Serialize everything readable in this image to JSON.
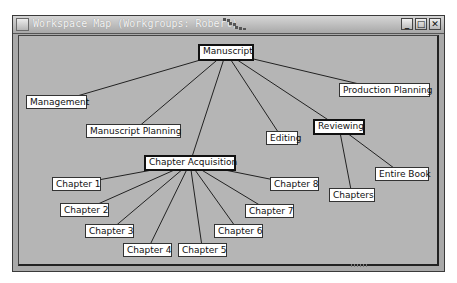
{
  "window": {
    "title": "Workspace Map (Workgroups: Robert)",
    "buttons": {
      "minimize": "_",
      "maximize": "□",
      "close": "✕"
    }
  },
  "map": {
    "root": {
      "id": "manuscript",
      "label": "Manuscript",
      "x": 198,
      "y": 44,
      "w": 56,
      "h": 17,
      "bold": true
    },
    "nodes": [
      {
        "id": "management",
        "label": "Management",
        "x": 26,
        "y": 95,
        "w": 61,
        "h": 14,
        "bold": false,
        "parent": "manuscript"
      },
      {
        "id": "manuscript-planning",
        "label": "Manuscript Planning",
        "x": 86,
        "y": 124,
        "w": 95,
        "h": 14,
        "bold": false,
        "parent": "manuscript"
      },
      {
        "id": "editing",
        "label": "Editing",
        "x": 266,
        "y": 131,
        "w": 32,
        "h": 14,
        "bold": false,
        "parent": "manuscript"
      },
      {
        "id": "production-planning",
        "label": "Production Planning",
        "x": 339,
        "y": 83,
        "w": 91,
        "h": 14,
        "bold": false,
        "parent": "manuscript"
      },
      {
        "id": "reviewing",
        "label": "Reviewing",
        "x": 313,
        "y": 119,
        "w": 52,
        "h": 16,
        "bold": true,
        "parent": "manuscript"
      },
      {
        "id": "entire-book",
        "label": "Entire Book",
        "x": 375,
        "y": 167,
        "w": 54,
        "h": 14,
        "bold": false,
        "parent": "reviewing"
      },
      {
        "id": "chapters",
        "label": "Chapters",
        "x": 329,
        "y": 188,
        "w": 46,
        "h": 14,
        "bold": false,
        "parent": "reviewing"
      },
      {
        "id": "chapter-acquisition",
        "label": "Chapter Acquisition",
        "x": 144,
        "y": 155,
        "w": 92,
        "h": 16,
        "bold": true,
        "parent": "manuscript"
      },
      {
        "id": "chapter-1",
        "label": "Chapter 1",
        "x": 52,
        "y": 177,
        "w": 49,
        "h": 14,
        "bold": false,
        "parent": "chapter-acquisition"
      },
      {
        "id": "chapter-2",
        "label": "Chapter 2",
        "x": 60,
        "y": 203,
        "w": 49,
        "h": 14,
        "bold": false,
        "parent": "chapter-acquisition"
      },
      {
        "id": "chapter-3",
        "label": "Chapter 3",
        "x": 85,
        "y": 224,
        "w": 49,
        "h": 14,
        "bold": false,
        "parent": "chapter-acquisition"
      },
      {
        "id": "chapter-4",
        "label": "Chapter 4",
        "x": 123,
        "y": 243,
        "w": 49,
        "h": 14,
        "bold": false,
        "parent": "chapter-acquisition"
      },
      {
        "id": "chapter-5",
        "label": "Chapter 5",
        "x": 178,
        "y": 243,
        "w": 49,
        "h": 14,
        "bold": false,
        "parent": "chapter-acquisition"
      },
      {
        "id": "chapter-6",
        "label": "Chapter 6",
        "x": 214,
        "y": 224,
        "w": 49,
        "h": 14,
        "bold": false,
        "parent": "chapter-acquisition"
      },
      {
        "id": "chapter-7",
        "label": "Chapter 7",
        "x": 245,
        "y": 204,
        "w": 49,
        "h": 14,
        "bold": false,
        "parent": "chapter-acquisition"
      },
      {
        "id": "chapter-8",
        "label": "Chapter 8",
        "x": 270,
        "y": 177,
        "w": 49,
        "h": 14,
        "bold": false,
        "parent": "chapter-acquisition"
      }
    ]
  },
  "colors": {
    "canvas": "#b5b5b5",
    "node_bg": "#ffffff",
    "edge": "#222222"
  }
}
